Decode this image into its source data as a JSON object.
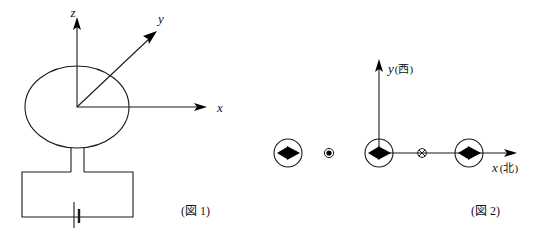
{
  "page": {
    "background_color": "#ffffff",
    "ink_color": "#1a1a1a",
    "width": 534,
    "height": 238
  },
  "figure1": {
    "caption": "(図 1)",
    "description": "circular current loop connected to a battery, with 3D coordinate axes at loop center",
    "axes": [
      {
        "id": "z",
        "label": "z",
        "direction": "up"
      },
      {
        "id": "y",
        "label": "y",
        "direction": "up-right-diagonal"
      },
      {
        "id": "x",
        "label": "x",
        "direction": "right"
      }
    ],
    "components": [
      {
        "name": "current-loop",
        "shape": "ellipse"
      },
      {
        "name": "lead-wires",
        "shape": "two-parallel-vertical-lines"
      },
      {
        "name": "circuit-rectangle",
        "shape": "rectangle"
      },
      {
        "name": "battery-symbol",
        "shape": "long-short-plate-pair"
      }
    ]
  },
  "figure2": {
    "caption": "(図 2)",
    "description": "top view showing compass-needle symbols along the x axis with current direction markers",
    "axes": [
      {
        "id": "y",
        "label": "y",
        "annotation": "(西)",
        "direction": "up"
      },
      {
        "id": "x",
        "label": "x",
        "annotation": "(北)",
        "direction": "right"
      }
    ],
    "markers": [
      {
        "name": "compass-needle-left",
        "type": "circled-arrowhead",
        "points": "right"
      },
      {
        "name": "current-out-of-page-dot",
        "type": "dot-in-circle"
      },
      {
        "name": "compass-needle-origin",
        "type": "circled-arrowhead",
        "points": "right"
      },
      {
        "name": "current-into-page-cross",
        "type": "cross-in-circle"
      },
      {
        "name": "compass-needle-right",
        "type": "circled-arrowhead",
        "points": "right"
      }
    ]
  }
}
